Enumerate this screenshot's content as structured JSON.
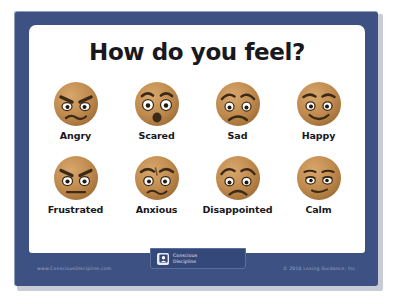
{
  "poster": {
    "title": "How do you feel?",
    "frame_color": "#3e5183",
    "board_color": "#ffffff",
    "title_color": "#19191d",
    "face_fill": "#c08a4e",
    "face_shadow": "#a06f38",
    "face_highlight": "#d4a267",
    "feature_color": "#3b2a18",
    "eye_white": "#ffffff"
  },
  "faces": [
    {
      "label": "Angry",
      "icon": "angry-face-icon",
      "emotion": "angry",
      "brows": "angled-down-inner",
      "eyes": "narrow-glaring",
      "mouth": "wavy-frown"
    },
    {
      "label": "Scared",
      "icon": "scared-face-icon",
      "emotion": "scared",
      "brows": "raised-arched",
      "eyes": "wide-open-round",
      "mouth": "open-oval"
    },
    {
      "label": "Sad",
      "icon": "sad-face-icon",
      "emotion": "sad",
      "brows": "inner-raised-worried",
      "eyes": "round-downcast",
      "mouth": "downturned-frown"
    },
    {
      "label": "Happy",
      "icon": "happy-face-icon",
      "emotion": "happy",
      "brows": "curved-raised",
      "eyes": "round-open",
      "mouth": "upturned-smile"
    },
    {
      "label": "Frustrated",
      "icon": "frustrated-face-icon",
      "emotion": "frustrated",
      "brows": "angled-down-inner",
      "eyes": "round-staring",
      "mouth": "flat-straight"
    },
    {
      "label": "Anxious",
      "icon": "anxious-face-icon",
      "emotion": "anxious",
      "brows": "furrowed-worried",
      "eyes": "round-uneasy",
      "mouth": "wavy-uncertain"
    },
    {
      "label": "Disappointed",
      "icon": "disappointed-face-icon",
      "emotion": "disappointed",
      "brows": "inner-raised-sad",
      "eyes": "round-downcast",
      "mouth": "downturned-frown"
    },
    {
      "label": "Calm",
      "icon": "calm-face-icon",
      "emotion": "calm",
      "brows": "relaxed-flat",
      "eyes": "half-lidded",
      "mouth": "slight-smile"
    }
  ],
  "footer": {
    "url": "www.ConsciousDiscipline.com",
    "copyright": "© 2010 Loving Guidance, Inc.",
    "logo": {
      "line1": "Conscious",
      "line2": "Discipline",
      "mark_icon": "conscious-discipline-logo-icon"
    }
  }
}
